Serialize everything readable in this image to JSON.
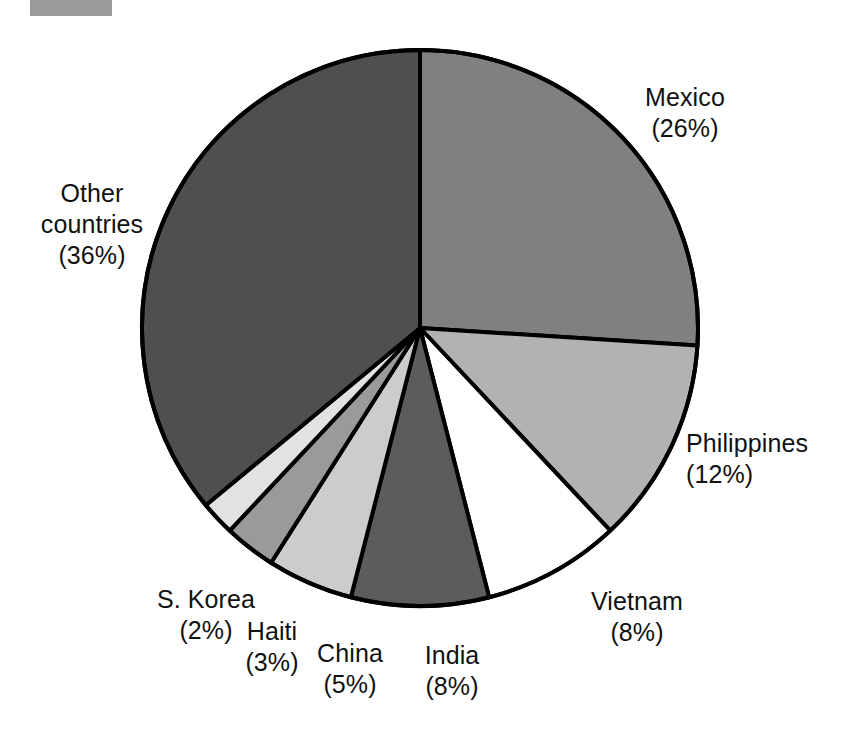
{
  "chart_data": {
    "type": "pie",
    "title": "",
    "subtitle": "",
    "xlabel": "",
    "ylabel": "",
    "legend_position": "none",
    "grid": false,
    "units": "percent",
    "start_angle_deg": -90,
    "direction": "clockwise",
    "categories": [
      "Mexico",
      "Philippines",
      "Vietnam",
      "India",
      "China",
      "Haiti",
      "S. Korea",
      "Other countries"
    ],
    "values": [
      26,
      12,
      8,
      8,
      5,
      3,
      2,
      36
    ],
    "slices": [
      {
        "label": "Mexico",
        "value": 26,
        "pct_text": "(26%)",
        "color": "#808080",
        "name_line": "Mexico",
        "name_line2": ""
      },
      {
        "label": "Philippines",
        "value": 12,
        "pct_text": "(12%)",
        "color": "#b2b2b2",
        "name_line": "Philippines",
        "name_line2": ""
      },
      {
        "label": "Vietnam",
        "value": 8,
        "pct_text": "(8%)",
        "color": "#ffffff",
        "name_line": "Vietnam",
        "name_line2": ""
      },
      {
        "label": "India",
        "value": 8,
        "pct_text": "(8%)",
        "color": "#5c5c5c",
        "name_line": "India",
        "name_line2": ""
      },
      {
        "label": "China",
        "value": 5,
        "pct_text": "(5%)",
        "color": "#cccccc",
        "name_line": "China",
        "name_line2": ""
      },
      {
        "label": "Haiti",
        "value": 3,
        "pct_text": "(3%)",
        "color": "#9a9a9a",
        "name_line": "Haiti",
        "name_line2": ""
      },
      {
        "label": "S. Korea",
        "value": 2,
        "pct_text": "(2%)",
        "color": "#e2e2e2",
        "name_line": "S. Korea",
        "name_line2": ""
      },
      {
        "label": "Other countries",
        "value": 36,
        "pct_text": "(36%)",
        "color": "#4f4f4f",
        "name_line": "Other",
        "name_line2": "countries"
      }
    ],
    "geometry": {
      "cx": 420,
      "cy": 328,
      "r": 278,
      "stroke": "#000000",
      "stroke_width": 4
    }
  },
  "labels": {
    "mexico": {
      "name": "Mexico",
      "pct": "(26%)"
    },
    "philippines": {
      "name": "Philippines",
      "pct": "(12%)"
    },
    "vietnam": {
      "name": "Vietnam",
      "pct": "(8%)"
    },
    "india": {
      "name": "India",
      "pct": "(8%)"
    },
    "china": {
      "name": "China",
      "pct": "(5%)"
    },
    "haiti": {
      "name": "Haiti",
      "pct": "(3%)"
    },
    "skorea": {
      "name": "S. Korea",
      "pct": "(2%)"
    },
    "other": {
      "name": "Other",
      "name2": "countries",
      "pct": "(36%)"
    }
  },
  "artifact": {
    "name": "scan-edge-mark",
    "color": "#9a9a9a"
  }
}
